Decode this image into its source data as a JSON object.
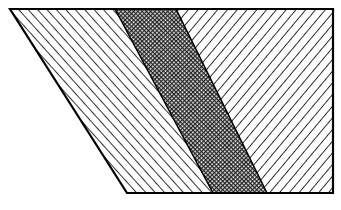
{
  "figure": {
    "outline": [
      [
        10,
        9
      ],
      [
        333,
        9
      ],
      [
        333,
        193
      ],
      [
        127,
        193
      ]
    ],
    "regions": [
      {
        "name": "left-region",
        "pattern": "forward-diagonal-hatch",
        "polygon": [
          [
            10,
            9
          ],
          [
            115,
            9
          ],
          [
            213,
            193
          ],
          [
            127,
            193
          ]
        ]
      },
      {
        "name": "center-band",
        "pattern": "dense-crosshatch",
        "polygon": [
          [
            115,
            9
          ],
          [
            176,
            9
          ],
          [
            267,
            193
          ],
          [
            213,
            193
          ]
        ]
      },
      {
        "name": "right-region",
        "pattern": "backward-diagonal-hatch",
        "polygon": [
          [
            176,
            9
          ],
          [
            333,
            9
          ],
          [
            333,
            193
          ],
          [
            267,
            193
          ]
        ]
      }
    ],
    "colors": {
      "line": "#000000",
      "background": "#ffffff",
      "band_fill": "#555555"
    }
  }
}
